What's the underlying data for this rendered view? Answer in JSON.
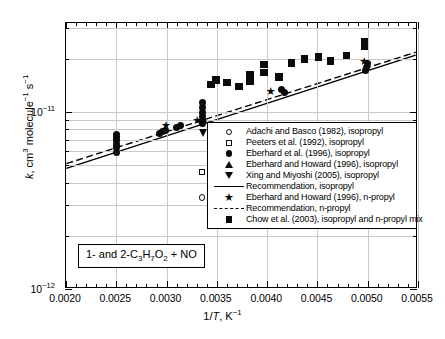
{
  "chart_data": {
    "type": "scatter",
    "title": "",
    "annotation": "1- and 2-C3H7O2 + NO",
    "annotation_html": "1- and 2-C<sub>3</sub>H<sub>7</sub>O<sub>2</sub> + NO",
    "xlabel": "1/T, K-1",
    "ylabel": "k, cm3 molecule-1 s-1",
    "xlim": [
      0.002,
      0.0055
    ],
    "ylim": [
      1e-12,
      3.2e-11
    ],
    "yscale": "log",
    "xticks": [
      "0.0020",
      "0.0025",
      "0.0030",
      "0.0035",
      "0.0040",
      "0.0045",
      "0.0050",
      "0.0055"
    ],
    "xtick_values": [
      0.002,
      0.0025,
      0.003,
      0.0035,
      0.004,
      0.0045,
      0.005,
      0.0055
    ],
    "yticks": [
      "10-11",
      "10-12"
    ],
    "ytick_values": [
      1e-11,
      1e-12
    ],
    "grid": "both",
    "legend_position": "center-right",
    "series": [
      {
        "name": "Adachi and Basco (1982), isopropyl",
        "marker": "circle-open",
        "x": [
          0.00335
        ],
        "y": [
          3.3e-12
        ]
      },
      {
        "name": "Peeters et al. (1992), isopropyl",
        "marker": "square-open",
        "x": [
          0.00335
        ],
        "y": [
          4.6e-12
        ]
      },
      {
        "name": "Eberhard et al. (1996), isopropyl",
        "marker": "circle-fill",
        "x": [
          0.0025,
          0.0025,
          0.0025,
          0.0025,
          0.0025,
          0.0025,
          0.00293,
          0.00296,
          0.00299,
          0.0031,
          0.00314,
          0.00336,
          0.00336,
          0.00336,
          0.00336,
          0.00336,
          0.00336,
          0.00414,
          0.00417,
          0.00498,
          0.00499,
          0.005
        ],
        "y": [
          6.3e-12,
          6.6e-12,
          6.9e-12,
          7.2e-12,
          7.5e-12,
          5.9e-12,
          7.6e-12,
          7.8e-12,
          7.9e-12,
          8.2e-12,
          8.4e-12,
          8.6e-12,
          9e-12,
          9.5e-12,
          1e-11,
          1.06e-11,
          1.13e-11,
          1.34e-11,
          1.3e-11,
          1.72e-11,
          1.8e-11,
          1.9e-11
        ]
      },
      {
        "name": "Eberhard and Howard (1996), isopropyl",
        "marker": "tri-up",
        "x": [
          0.00336
        ],
        "y": [
          9.2e-12
        ]
      },
      {
        "name": "Xing and Miyoshi (2005), isopropyl",
        "marker": "tri-dn",
        "x": [
          0.00337
        ],
        "y": [
          7.6e-12
        ]
      },
      {
        "name": "Recommendation, isopropyl",
        "marker": "line-solid",
        "x": [
          0.002,
          0.0055
        ],
        "y": [
          4.75e-12,
          2.1e-11
        ]
      },
      {
        "name": "Eberhard and Howard (1996), n-propyl",
        "marker": "star",
        "x": [
          0.003,
          0.00331,
          0.00404,
          0.00497
        ],
        "y": [
          8.4e-12,
          8.9e-12,
          1.3e-11,
          1.92e-11
        ]
      },
      {
        "name": "Recommendation, n-propyl",
        "marker": "line-dashed",
        "x": [
          0.002,
          0.0055
        ],
        "y": [
          5.05e-12,
          2.18e-11
        ]
      },
      {
        "name": "Chow et al. (2003), isopropyl and n-propyl mix",
        "marker": "square-fill",
        "x": [
          0.00344,
          0.00349,
          0.0036,
          0.00372,
          0.00383,
          0.00383,
          0.00397,
          0.00397,
          0.00412,
          0.00424,
          0.00437,
          0.00451,
          0.00463,
          0.00479,
          0.00497,
          0.00497
        ],
        "y": [
          1.44e-11,
          1.52e-11,
          1.47e-11,
          1.4e-11,
          1.5e-11,
          1.62e-11,
          1.68e-11,
          1.86e-11,
          1.58e-11,
          1.9e-11,
          2e-11,
          2.05e-11,
          1.95e-11,
          2.1e-11,
          2.35e-11,
          2.5e-11
        ]
      }
    ]
  },
  "legend": {
    "items": [
      {
        "marker": "circle-open",
        "label": "Adachi and Basco (1982), isopropyl"
      },
      {
        "marker": "square-open",
        "label": "Peeters et al. (1992), isopropyl"
      },
      {
        "marker": "circle-fill",
        "label": "Eberhard et al. (1996), isopropyl"
      },
      {
        "marker": "tri-up",
        "label": "Eberhard and Howard (1996), isopropyl"
      },
      {
        "marker": "tri-dn",
        "label": "Xing and Miyoshi  (2005), isopropyl"
      },
      {
        "marker": "line-solid",
        "label": "Recommendation, isopropyl"
      },
      {
        "marker": "star",
        "label": "Eberhard and Howard (1996), n-propyl"
      },
      {
        "marker": "line-dashed",
        "label": "Recommendation, n-propyl"
      },
      {
        "marker": "square-fill",
        "label": "Chow et al. (2003), isopropyl and n-propyl mix"
      }
    ]
  },
  "axes": {
    "x_title_prefix": "1/",
    "x_title_italic": "T",
    "x_title_suffix": ", K",
    "x_title_exp": "-1",
    "y_title_italic": "k",
    "y_title_rest": ", cm",
    "y_title_exp1": "3",
    "y_title_mid": " molecule",
    "y_title_exp2": "-1",
    "y_title_mid2": " s",
    "y_title_exp3": "-1"
  },
  "colors": {
    "marker": "#0b0b0b",
    "axis": "#000000",
    "grid": "#c9c9c9",
    "background": "#ffffff"
  }
}
